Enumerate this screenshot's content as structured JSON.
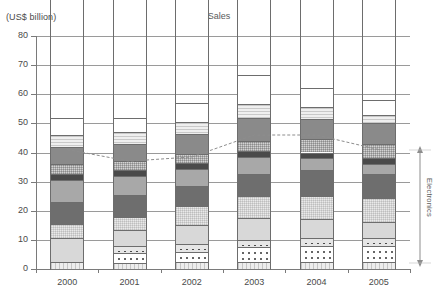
{
  "chart": {
    "title": "Sales",
    "unit_label": "(US$ billion)",
    "annotation": "Electronics"
  },
  "chart_data": {
    "type": "bar",
    "title": "Sales",
    "xlabel": "",
    "ylabel": "(US$ billion)",
    "ylim": [
      0,
      80
    ],
    "yticks": [
      0,
      10,
      20,
      30,
      40,
      50,
      60,
      70,
      80
    ],
    "grid": true,
    "legend": null,
    "stacked": true,
    "categories": [
      "2000",
      "2001",
      "2002",
      "2003",
      "2004",
      "2005"
    ],
    "totals": [
      58,
      57,
      62,
      72,
      66.5,
      61
    ],
    "series": [
      {
        "name": "s1-base-vstripe",
        "fill": "f-vstripe",
        "values": [
          2.5,
          2.0,
          2.5,
          2.5,
          2.5,
          2.5
        ]
      },
      {
        "name": "s2-dots-open",
        "fill": "f-dots",
        "values": [
          0.0,
          3.5,
          3.5,
          5.0,
          5.5,
          5.5
        ]
      },
      {
        "name": "s3-dots-filled",
        "fill": "f-dots-sq",
        "values": [
          0.0,
          2.5,
          2.5,
          2.5,
          2.5,
          2.5
        ]
      },
      {
        "name": "s4-light",
        "fill": "f-light",
        "values": [
          8.0,
          5.5,
          6.5,
          7.5,
          6.5,
          5.5
        ]
      },
      {
        "name": "s5-checker",
        "fill": "f-checker",
        "values": [
          5.0,
          4.5,
          6.5,
          7.5,
          8.0,
          8.5
        ]
      },
      {
        "name": "s6-vdark",
        "fill": "f-vdark",
        "values": [
          7.5,
          7.5,
          7.0,
          7.5,
          9.0,
          8.0
        ]
      },
      {
        "name": "s7-grey",
        "fill": "f-grey",
        "values": [
          7.5,
          6.5,
          6.0,
          6.0,
          4.0,
          3.5
        ]
      },
      {
        "name": "s8-black",
        "fill": "f-black",
        "values": [
          2.0,
          2.0,
          2.0,
          2.0,
          2.0,
          2.0
        ]
      },
      {
        "name": "s9-checker-dark",
        "fill": "f-checker-d",
        "values": [
          3.5,
          3.0,
          3.0,
          3.5,
          4.5,
          5.0
        ]
      },
      {
        "name": "s10-dark",
        "fill": "f-dark",
        "values": [
          6.0,
          6.0,
          7.0,
          8.0,
          7.0,
          7.0
        ]
      },
      {
        "name": "s11-hstripe",
        "fill": "f-hstripe",
        "values": [
          4.0,
          4.0,
          4.0,
          4.5,
          4.0,
          3.0
        ]
      },
      {
        "name": "s12-white-top",
        "fill": "f-white",
        "values": [
          6.0,
          5.0,
          6.5,
          10.0,
          6.5,
          5.0
        ]
      }
    ],
    "line_series": {
      "name": "electronics-threshold-line",
      "style": "dashed-grey",
      "values": [
        41,
        37,
        38.5,
        46,
        46,
        41
      ]
    },
    "electronics_band": {
      "label": "Electronics",
      "from": 2,
      "to": 42
    }
  }
}
